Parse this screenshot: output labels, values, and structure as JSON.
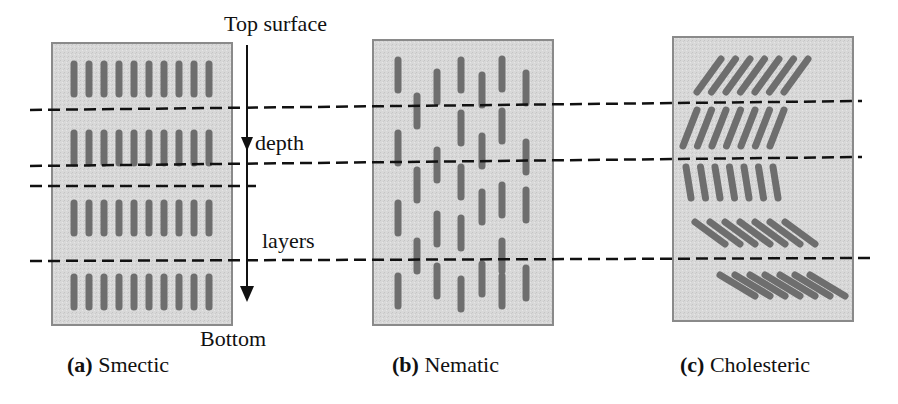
{
  "figure": {
    "annotations": {
      "top_surface": "Top surface",
      "depth": "depth",
      "layers": "layers",
      "bottom": "Bottom"
    },
    "panels": [
      {
        "id": "smectic",
        "letter": "(a)",
        "name": "Smectic",
        "arrangement": "layered, molecules vertical and aligned in rows",
        "rows": 4,
        "molecules_per_row": 10
      },
      {
        "id": "nematic",
        "letter": "(b)",
        "name": "Nematic",
        "arrangement": "vertical orientation, random positions",
        "columns": 7
      },
      {
        "id": "cholesteric",
        "letter": "(c)",
        "name": "Cholesteric",
        "arrangement": "layered, orientation rotates with depth",
        "layers": 5,
        "molecules_per_layer": 7
      }
    ],
    "colors": {
      "panel_fill": "#d6d6d6",
      "panel_border": "#8a8a8a",
      "molecule": "#6e6e6e",
      "line": "#111111"
    }
  }
}
